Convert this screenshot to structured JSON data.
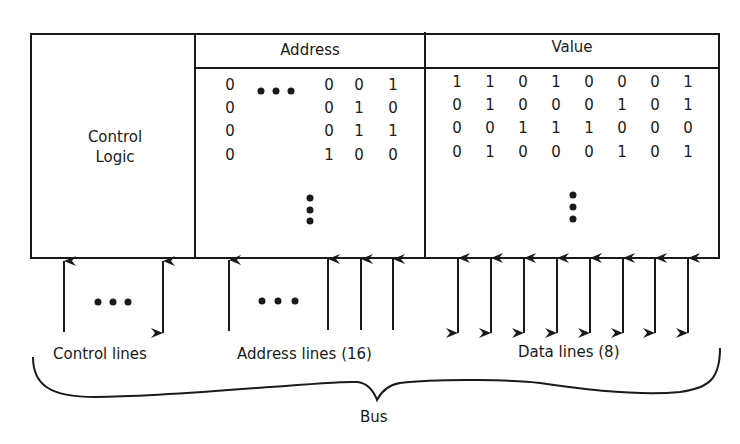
{
  "memory": {
    "control_logic_label": [
      "Control",
      "Logic"
    ],
    "address_header": "Address",
    "value_header": "Value",
    "address_rows": [
      {
        "msb": "0",
        "bits": [
          "0",
          "0",
          "1"
        ]
      },
      {
        "msb": "0",
        "bits": [
          "0",
          "1",
          "0"
        ]
      },
      {
        "msb": "0",
        "bits": [
          "0",
          "1",
          "1"
        ]
      },
      {
        "msb": "0",
        "bits": [
          "1",
          "0",
          "0"
        ]
      }
    ],
    "value_rows": [
      [
        "1",
        "1",
        "0",
        "1",
        "0",
        "0",
        "0",
        "1"
      ],
      [
        "0",
        "1",
        "0",
        "0",
        "0",
        "1",
        "0",
        "1"
      ],
      [
        "0",
        "0",
        "1",
        "1",
        "1",
        "0",
        "0",
        "0"
      ],
      [
        "0",
        "1",
        "0",
        "0",
        "0",
        "1",
        "0",
        "1"
      ]
    ],
    "ellipsis_horizontal": "•••",
    "ellipsis_vertical": "vertical-dots"
  },
  "bus": {
    "control_lines_label": "Control lines",
    "address_lines_label": "Address lines (16)",
    "data_lines_label": "Data lines (8)",
    "bus_label": "Bus",
    "control_arrows": [
      "up",
      "bidirectional"
    ],
    "address_arrows": [
      "up",
      "up",
      "up",
      "up"
    ],
    "data_arrows": [
      "bidirectional",
      "bidirectional",
      "bidirectional",
      "bidirectional",
      "bidirectional",
      "bidirectional",
      "bidirectional",
      "bidirectional"
    ]
  }
}
